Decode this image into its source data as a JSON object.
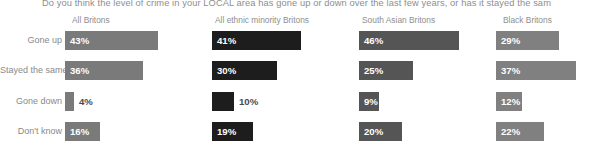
{
  "chart_data": {
    "type": "bar",
    "title": "Do you think the level of crime in your LOCAL area has gone up or down over the last few years, or has it stayed the sam",
    "xlabel": "",
    "ylabel": "",
    "xlim": [
      0,
      50
    ],
    "grid": false,
    "legend": "none",
    "orientation": "horizontal",
    "categories": [
      "Gone up",
      "Stayed the same",
      "Gone down",
      "Don't know"
    ],
    "series": [
      {
        "name": "All Britons",
        "color": "#7a7a7a",
        "values": [
          43,
          36,
          4,
          16
        ],
        "labels": [
          "43%",
          "36%",
          "4%",
          "16%"
        ],
        "label_inside": [
          true,
          true,
          false,
          true
        ]
      },
      {
        "name": "All ethnic minority Britons",
        "color": "#1d1d1d",
        "values": [
          41,
          30,
          10,
          19
        ],
        "labels": [
          "41%",
          "30%",
          "10%",
          "19%"
        ],
        "label_inside": [
          true,
          true,
          false,
          true
        ]
      },
      {
        "name": "South Asian Britons",
        "color": "#555555",
        "values": [
          46,
          25,
          9,
          20
        ],
        "labels": [
          "46%",
          "25%",
          "9%",
          "20%"
        ],
        "label_inside": [
          true,
          true,
          true,
          true
        ]
      },
      {
        "name": "Black Britons",
        "color": "#808080",
        "values": [
          29,
          37,
          12,
          22
        ],
        "labels": [
          "29%",
          "37%",
          "12%",
          "22%"
        ],
        "label_inside": [
          true,
          true,
          true,
          true
        ]
      }
    ]
  },
  "layout": {
    "row_tops": [
      31,
      61,
      92,
      122
    ],
    "col_lefts": [
      65,
      212,
      359,
      496
    ],
    "px_per_percent": 2.17,
    "header_lefts": [
      72,
      215,
      362,
      503
    ]
  }
}
